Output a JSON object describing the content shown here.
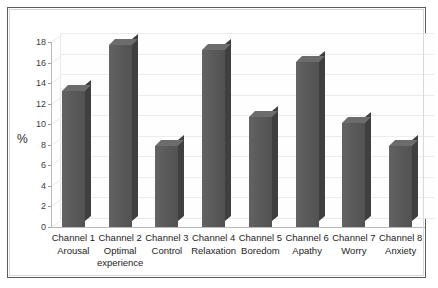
{
  "chart_data": {
    "type": "bar",
    "title": "",
    "xlabel": "",
    "ylabel": "%",
    "ylim": [
      0,
      18
    ],
    "grid": true,
    "legend": "none",
    "style": "3d-column",
    "yticks": [
      18,
      16,
      14,
      12,
      10,
      8,
      6,
      4,
      2,
      0
    ],
    "categories": [
      "Channel 1 Arousal",
      "Channel 2 Optimal experience",
      "Channel 3 Control",
      "Channel 4 Relaxation",
      "Channel 5 Boredom",
      "Channel 6 Apathy",
      "Channel 7 Worry",
      "Channel 8 Anxiety"
    ],
    "channels": [
      "Channel 1",
      "Channel 2",
      "Channel 3",
      "Channel 4",
      "Channel 5",
      "Channel 6",
      "Channel 7",
      "Channel 8"
    ],
    "channel_names": [
      "Arousal",
      "Optimal experience",
      "Control",
      "Relaxation",
      "Boredom",
      "Apathy",
      "Worry",
      "Anxiety"
    ],
    "values": [
      13.2,
      17.7,
      7.9,
      17.2,
      10.7,
      16.1,
      10.1,
      7.9
    ],
    "bar_color": "#5a5a5a",
    "bar_side_color": "#3f3f3f",
    "bar_top_color": "#6c6c6c",
    "grid_color": "#ececec",
    "axis_color": "#b9b9b9",
    "background_color": "#ffffff"
  }
}
